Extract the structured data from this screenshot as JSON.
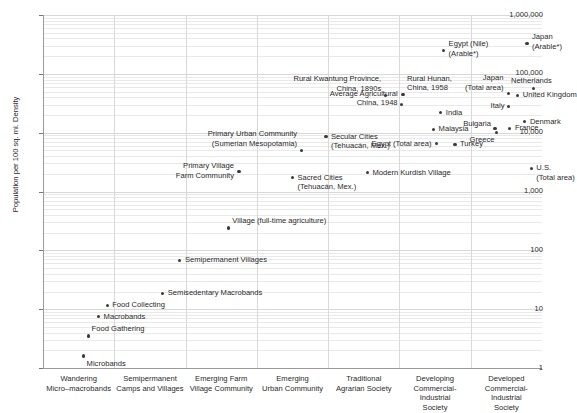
{
  "chart_data": {
    "type": "scatter",
    "title": "",
    "xlabel": "",
    "ylabel": "Population per 100 sq. mi. Density",
    "ylim": [
      1,
      1000000
    ],
    "yscale": "log",
    "grid": true,
    "legend": "none",
    "ytick_labels": [
      "1,000,000",
      "100,000",
      "10,000",
      "1,000",
      "100",
      "10",
      "1"
    ],
    "ytick_values": [
      1000000,
      100000,
      10000,
      1000,
      100,
      10,
      1
    ],
    "categories": [
      "Wandering\nMicro–macrobands",
      "Semipermanent\nCamps and Villages",
      "Emerging Farm\nVillage Community",
      "Emerging\nUrban Community",
      "Traditional\nAgrarian Society",
      "Developing\nCommercial-Industrial\nSociety",
      "Developed\nCommercial-Industrial\nSociety"
    ],
    "points": [
      {
        "label": "Microbands",
        "x": 0.07,
        "y": 1.6,
        "lx": 3,
        "ly": 3,
        "align": "right"
      },
      {
        "label": "Food Gathering",
        "x": 0.14,
        "y": 3.5,
        "lx": 3,
        "ly": -12,
        "align": "right"
      },
      {
        "label": "Macrobands",
        "x": 0.28,
        "y": 7.6,
        "lx": 5,
        "ly": -4,
        "align": "right"
      },
      {
        "label": "Food Collecting",
        "x": 0.4,
        "y": 11.6,
        "lx": 5,
        "ly": -5,
        "align": "right"
      },
      {
        "label": "Semisedentary Macrobands",
        "x": 1.18,
        "y": 18.5,
        "lx": 5,
        "ly": -5,
        "align": "right"
      },
      {
        "label": "Semipermanent Villages",
        "x": 1.42,
        "y": 68,
        "lx": 5,
        "ly": -5,
        "align": "right"
      },
      {
        "label": "Village (full-time agriculture)",
        "x": 2.1,
        "y": 240,
        "lx": 4,
        "ly": -12,
        "align": "right"
      },
      {
        "label": "Primary Village\nFarm Community",
        "x": 2.25,
        "y": 2200,
        "lx": -5,
        "ly": -10,
        "align": "left"
      },
      {
        "label": "Primary Urban Community\n(Sumerian Mesopotamia)",
        "x": 3.12,
        "y": 5000,
        "lx": -4,
        "ly": -21,
        "align": "left"
      },
      {
        "label": "Secular Cities\n(Tehuacán, Mex.)",
        "x": 3.47,
        "y": 8600,
        "lx": 5,
        "ly": -5,
        "align": "right"
      },
      {
        "label": "Sacred Cities\n(Tehuacán, Mex.)",
        "x": 3.0,
        "y": 1700,
        "lx": 5,
        "ly": -5,
        "align": "right"
      },
      {
        "label": "Modern Kurdish Village",
        "x": 4.05,
        "y": 2100,
        "lx": 5,
        "ly": -5,
        "align": "right"
      },
      {
        "label": "Rural Kwantung Province,\nChina, 1890s",
        "x": 4.3,
        "y": 43000,
        "lx": -4,
        "ly": -21,
        "align": "left"
      },
      {
        "label": "Average Agricultural\nChina, 1948",
        "x": 4.53,
        "y": 30000,
        "lx": -4,
        "ly": -16,
        "align": "left"
      },
      {
        "label": "Rural Hunan,\nChina, 1958",
        "x": 4.55,
        "y": 44000,
        "lx": 4,
        "ly": -21,
        "align": "right"
      },
      {
        "label": "Egypt (Total area)",
        "x": 5.02,
        "y": 6500,
        "lx": -5,
        "ly": -5,
        "align": "left"
      },
      {
        "label": "Egypt (Nile)\n(Arable*)",
        "x": 5.12,
        "y": 250000,
        "lx": 5,
        "ly": -11,
        "align": "right"
      },
      {
        "label": "Malaysia",
        "x": 4.98,
        "y": 11500,
        "lx": 5,
        "ly": -5,
        "align": "right"
      },
      {
        "label": "India",
        "x": 5.08,
        "y": 22000,
        "lx": 5,
        "ly": -5,
        "align": "right"
      },
      {
        "label": "Turkey",
        "x": 5.28,
        "y": 6400,
        "lx": 5,
        "ly": -5,
        "align": "right"
      },
      {
        "label": "Bulgaria",
        "x": 5.84,
        "y": 11800,
        "lx": -4,
        "ly": -9,
        "align": "left"
      },
      {
        "label": "Greece",
        "x": 5.86,
        "y": 10000,
        "lx": -2,
        "ly": 2,
        "align": "left"
      },
      {
        "label": "Japan\n(Total area)",
        "x": 6.03,
        "y": 47000,
        "lx": -5,
        "ly": -20,
        "align": "left"
      },
      {
        "label": "Italy",
        "x": 6.03,
        "y": 28000,
        "lx": -4,
        "ly": -5,
        "align": "left"
      },
      {
        "label": "France",
        "x": 6.05,
        "y": 11800,
        "lx": 5,
        "ly": -5,
        "align": "right"
      },
      {
        "label": "Japan\n(Arable*)",
        "x": 6.29,
        "y": 330000,
        "lx": 5,
        "ly": -11,
        "align": "right"
      },
      {
        "label": "Denmark",
        "x": 6.26,
        "y": 15500,
        "lx": 5,
        "ly": -5,
        "align": "right"
      },
      {
        "label": "Netherlands",
        "x": 6.38,
        "y": 57000,
        "lx": -2,
        "ly": -12,
        "align": "center"
      },
      {
        "label": "United Kingdom",
        "x": 6.16,
        "y": 43000,
        "lx": 5,
        "ly": -5,
        "align": "right"
      },
      {
        "label": "U.S.\n(Total area)",
        "x": 6.35,
        "y": 2500,
        "lx": 5,
        "ly": -5,
        "align": "right"
      }
    ]
  }
}
